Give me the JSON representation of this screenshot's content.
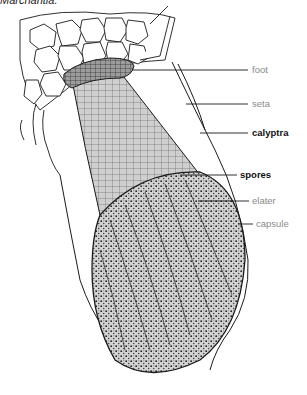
{
  "figure": {
    "title": "Marchantia.",
    "colors": {
      "line": "#1a1a1a",
      "seta_fill": "#c8c8c8",
      "capsule_fill": "#9a9a9a",
      "label_gray": "#8a8a8a",
      "label_black": "#111111"
    }
  },
  "labels": [
    {
      "id": "foot",
      "text": "foot",
      "style": "gray",
      "x": 252,
      "y": 66,
      "line_from": [
        170,
        70
      ],
      "line_to": [
        248,
        70
      ]
    },
    {
      "id": "seta",
      "text": "seta",
      "style": "gray",
      "x": 252,
      "y": 100,
      "line_from": [
        186,
        104
      ],
      "line_to": [
        248,
        104
      ]
    },
    {
      "id": "calyptra",
      "text": "calyptra",
      "style": "black",
      "x": 252,
      "y": 129,
      "line_from": [
        200,
        133
      ],
      "line_to": [
        248,
        133
      ]
    },
    {
      "id": "spores",
      "text": "spores",
      "style": "black",
      "x": 240,
      "y": 171,
      "line_from": [
        180,
        175
      ],
      "line_to": [
        237,
        175
      ]
    },
    {
      "id": "elater",
      "text": "elater",
      "style": "gray",
      "x": 252,
      "y": 197,
      "line_from": [
        198,
        201
      ],
      "line_to": [
        249,
        201
      ]
    },
    {
      "id": "capsule",
      "text": "capsule",
      "style": "gray",
      "x": 256,
      "y": 220,
      "line_from": [
        236,
        224
      ],
      "line_to": [
        253,
        224
      ]
    }
  ]
}
